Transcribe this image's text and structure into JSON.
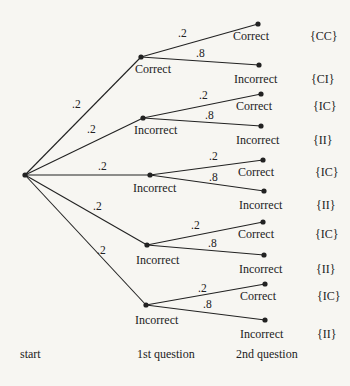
{
  "colors": {
    "background": "#f7f6f2",
    "ink": "#222222"
  },
  "start": {
    "label": "start",
    "x": 25,
    "y": 175
  },
  "column_labels": [
    {
      "text": "start",
      "x": 20,
      "y": 348
    },
    {
      "text": "1st question",
      "x": 137,
      "y": 348
    },
    {
      "text": "2nd question",
      "x": 236,
      "y": 348
    }
  ],
  "first": [
    {
      "label": "Correct",
      "prob": ".2",
      "x": 141,
      "y": 57,
      "lx": 135,
      "ly": 63,
      "px": 72,
      "py": 99,
      "children": [
        {
          "label": "Correct",
          "outcome": "{CC}",
          "prob": ".2",
          "x": 258,
          "y": 24,
          "px": 178,
          "py": 28
        },
        {
          "label": "Incorrect",
          "outcome": "{CI}",
          "prob": ".8",
          "x": 259,
          "y": 65,
          "px": 196,
          "py": 48
        }
      ]
    },
    {
      "label": "Incorrect",
      "prob": ".2",
      "x": 143,
      "y": 118,
      "lx": 134,
      "ly": 124,
      "px": 87,
      "py": 124,
      "children": [
        {
          "label": "Correct",
          "outcome": "{IC}",
          "prob": ".2",
          "x": 261,
          "y": 94,
          "px": 199,
          "py": 90
        },
        {
          "label": "Incorrect",
          "outcome": "{II}",
          "prob": ".8",
          "x": 261,
          "y": 126,
          "px": 205,
          "py": 110
        }
      ]
    },
    {
      "label": "Incorrect",
      "prob": ".2",
      "x": 150,
      "y": 175,
      "lx": 133,
      "ly": 182,
      "px": 98,
      "py": 161,
      "children": [
        {
          "label": "Correct",
          "outcome": "{IC}",
          "prob": ".2",
          "x": 263,
          "y": 160,
          "px": 209,
          "py": 151
        },
        {
          "label": "Incorrect",
          "outcome": "{II}",
          "prob": ".8",
          "x": 264,
          "y": 191,
          "px": 209,
          "py": 172
        }
      ]
    },
    {
      "label": "Incorrect",
      "prob": ".2",
      "x": 147,
      "y": 245,
      "lx": 136,
      "ly": 254,
      "px": 93,
      "py": 201,
      "children": [
        {
          "label": "Correct",
          "outcome": "{IC}",
          "prob": ".2",
          "x": 263,
          "y": 222,
          "px": 191,
          "py": 220
        },
        {
          "label": "Incorrect",
          "outcome": "{II}",
          "prob": ".8",
          "x": 264,
          "y": 255,
          "px": 208,
          "py": 238
        }
      ]
    },
    {
      "label": "Incorrect",
      "prob": ".2",
      "x": 146,
      "y": 305,
      "lx": 135,
      "ly": 314,
      "px": 97,
      "py": 245,
      "children": [
        {
          "label": "Correct",
          "outcome": "{IC}",
          "prob": ".2",
          "x": 265,
          "y": 284,
          "px": 198,
          "py": 283
        },
        {
          "label": "Incorrect",
          "outcome": "{II}",
          "prob": ".8",
          "x": 265,
          "y": 320,
          "px": 203,
          "py": 299
        }
      ]
    }
  ]
}
